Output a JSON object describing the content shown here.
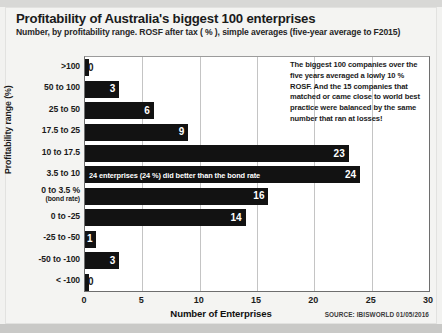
{
  "chart_data": {
    "type": "bar",
    "orientation": "horizontal",
    "title": "Profitability of Australia's biggest 100 enterprises",
    "subtitle": "Number, by profitability range. ROSF after tax ( % ), simple averages (five-year average to F2015)",
    "xlabel": "Number of Enterprises",
    "ylabel": "Profitability range (%)",
    "xlim": [
      0,
      30
    ],
    "xticks": [
      0,
      5,
      10,
      15,
      20,
      25,
      30
    ],
    "xtick_labels": [
      "0",
      "5",
      "10",
      "15",
      "20",
      "25",
      "30"
    ],
    "grid": true,
    "legend": "none",
    "bar_color": "#121212",
    "plot_background": "#ffffff",
    "categories": [
      ">100",
      "50 to 100",
      "25 to 50",
      "17.5 to 25",
      "10 to 17.5",
      "3.5 to 10",
      "0 to 3.5 %",
      "0 to -25",
      "-25 to -50",
      "-50 to -100",
      "< -100"
    ],
    "category_sublabels": [
      "",
      "",
      "",
      "",
      "",
      "",
      "(bond rate)",
      "",
      "",
      "",
      ""
    ],
    "values": [
      0,
      3,
      6,
      9,
      23,
      24,
      16,
      14,
      1,
      3,
      0
    ],
    "data_labels": [
      "0",
      "3",
      "6",
      "9",
      "23",
      "24",
      "16",
      "14",
      "1",
      "3",
      "0"
    ],
    "annotations": [
      {
        "id": "bond-rate-note",
        "text": "24 enterprises (24 %) did better than the bond rate",
        "attached_to_category": "3.5 to 10"
      },
      {
        "id": "commentary-box",
        "text": "The biggest 100 companies over the five years averaged a lowly 10 % ROSF.  And the 15 companies that matched or came close to world best practice were balanced by the same number that ran at losses!"
      }
    ],
    "source": "SOURCE: IBISWORLD 01/05/2016"
  }
}
